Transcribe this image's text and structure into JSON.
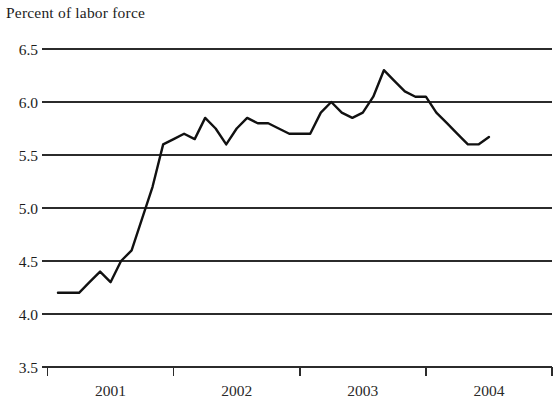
{
  "chart_data": {
    "type": "line",
    "title": "Percent of labor force",
    "xlabel": "",
    "ylabel": "Percent of labor force",
    "ylim": [
      3.5,
      6.5
    ],
    "yticks": [
      "3.5",
      "4.0",
      "4.5",
      "5.0",
      "5.5",
      "6.0",
      "6.5"
    ],
    "ytick_values": [
      3.5,
      4.0,
      4.5,
      5.0,
      5.5,
      6.0,
      6.5
    ],
    "xticks": [
      "2001",
      "2002",
      "2003",
      "2004"
    ],
    "xtick_values": [
      2001,
      2002,
      2003,
      2004
    ],
    "xlim": [
      2000.5,
      2004.5
    ],
    "grid": true,
    "legend": false,
    "series": [
      {
        "name": "Unemployment rate",
        "color": "#111111",
        "x": [
          2000.583,
          2000.667,
          2000.75,
          2000.833,
          2000.917,
          2001.0,
          2001.083,
          2001.167,
          2001.25,
          2001.333,
          2001.417,
          2001.5,
          2001.583,
          2001.667,
          2001.75,
          2001.833,
          2001.917,
          2002.0,
          2002.083,
          2002.167,
          2002.25,
          2002.333,
          2002.417,
          2002.5,
          2002.583,
          2002.667,
          2002.75,
          2002.833,
          2002.917,
          2003.0,
          2003.083,
          2003.167,
          2003.25,
          2003.333,
          2003.417,
          2003.5,
          2003.583,
          2003.667,
          2003.75,
          2003.833,
          2003.917,
          2004.0
        ],
        "values": [
          4.2,
          4.2,
          4.2,
          4.3,
          4.4,
          4.3,
          4.5,
          4.6,
          4.9,
          5.2,
          5.6,
          5.65,
          5.7,
          5.65,
          5.85,
          5.75,
          5.6,
          5.75,
          5.85,
          5.8,
          5.8,
          5.75,
          5.7,
          5.7,
          5.7,
          5.9,
          6.0,
          5.9,
          5.85,
          5.9,
          6.05,
          6.3,
          6.2,
          6.1,
          6.05,
          6.05,
          5.9,
          5.8,
          5.7,
          5.6,
          5.6,
          5.67
        ]
      }
    ]
  },
  "axes": {
    "y_axis_name": "y-axis",
    "x_axis_name": "x-axis"
  }
}
